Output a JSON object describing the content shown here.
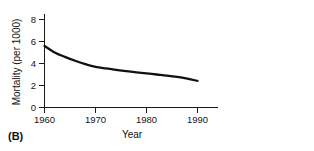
{
  "figure": {
    "panel_label": "(B)"
  },
  "chart_data": {
    "type": "line",
    "title": "",
    "xlabel": "Year",
    "ylabel": "Mortality (per 1000)",
    "xlim": [
      1960,
      1995
    ],
    "ylim": [
      0,
      8.8
    ],
    "xticks": [
      1960,
      1970,
      1980,
      1990
    ],
    "xtick_labels": [
      "1960",
      "1970",
      "1980",
      "1990"
    ],
    "yticks": [
      0,
      2,
      4,
      6,
      8
    ],
    "ytick_labels": [
      "0",
      "2",
      "4",
      "6",
      "8"
    ],
    "grid": false,
    "legend": false,
    "series": [
      {
        "name": "Mortality",
        "x": [
          1960,
          1962,
          1964,
          1966,
          1968,
          1970,
          1972,
          1974,
          1976,
          1978,
          1980,
          1982,
          1984,
          1986,
          1988,
          1990
        ],
        "values": [
          5.6,
          5.0,
          4.6,
          4.25,
          3.95,
          3.7,
          3.55,
          3.42,
          3.3,
          3.2,
          3.1,
          3.0,
          2.9,
          2.78,
          2.62,
          2.42
        ]
      }
    ]
  }
}
